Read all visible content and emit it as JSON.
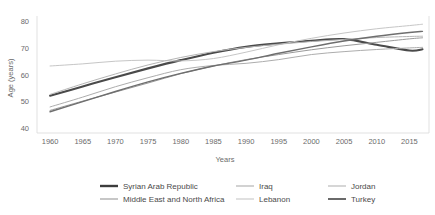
{
  "chart_data": {
    "type": "line",
    "title": "",
    "xlabel": "Years",
    "ylabel": "Age (years)",
    "xlim": [
      1958,
      2018
    ],
    "ylim": [
      38,
      82
    ],
    "xticks": [
      1960,
      1965,
      1970,
      1975,
      1980,
      1985,
      1990,
      1995,
      2000,
      2005,
      2010,
      2015
    ],
    "yticks": [
      40,
      50,
      60,
      70,
      80
    ],
    "grid": false,
    "legend_position": "bottom",
    "x": [
      1960,
      1965,
      1970,
      1975,
      1980,
      1985,
      1990,
      1995,
      2000,
      2005,
      2010,
      2015,
      2017
    ],
    "series": [
      {
        "name": "Syrian Arab Republic",
        "color": "#4a4a4a",
        "width": 2.1,
        "values": [
          52.0,
          55.5,
          59.0,
          62.3,
          65.4,
          68.2,
          70.4,
          71.7,
          72.7,
          73.3,
          71.2,
          69.0,
          69.5
        ]
      },
      {
        "name": "Middle East and North Africa",
        "color": "#9a9a9a",
        "width": 1.0,
        "values": [
          46.5,
          50.0,
          53.4,
          56.8,
          60.3,
          63.2,
          65.6,
          67.5,
          69.3,
          70.8,
          72.1,
          73.4,
          73.8
        ]
      },
      {
        "name": "Iraq",
        "color": "#adadad",
        "width": 1.0,
        "values": [
          47.8,
          51.5,
          55.4,
          58.8,
          61.8,
          63.4,
          64.2,
          65.6,
          67.5,
          68.6,
          69.4,
          70.0,
          70.2
        ]
      },
      {
        "name": "Lebanon",
        "color": "#c6c6c6",
        "width": 1.0,
        "values": [
          63.2,
          64.0,
          65.0,
          65.4,
          65.1,
          66.0,
          68.4,
          71.2,
          73.6,
          75.6,
          77.2,
          78.4,
          78.9
        ]
      },
      {
        "name": "Jordan",
        "color": "#b5b5b5",
        "width": 1.0,
        "values": [
          52.5,
          56.5,
          60.2,
          63.6,
          66.4,
          68.6,
          70.2,
          71.4,
          72.4,
          73.2,
          73.9,
          74.3,
          74.4
        ]
      },
      {
        "name": "Turkey",
        "color": "#6e6e6e",
        "width": 1.4,
        "values": [
          46.0,
          49.8,
          53.6,
          57.2,
          60.4,
          63.2,
          65.4,
          68.0,
          70.4,
          72.6,
          74.4,
          75.8,
          76.2
        ]
      }
    ]
  },
  "legend": {
    "entries": [
      {
        "label": "Syrian Arab Republic",
        "color": "#3d3d3d",
        "width": 2.4
      },
      {
        "label": "Iraq",
        "color": "#adadad",
        "width": 1.1
      },
      {
        "label": "Jordan",
        "color": "#b5b5b5",
        "width": 1.1
      },
      {
        "label": "Middle East and North Africa",
        "color": "#9a9a9a",
        "width": 1.1
      },
      {
        "label": "Lebanon",
        "color": "#c6c6c6",
        "width": 1.1
      },
      {
        "label": "Turkey",
        "color": "#5a5a5a",
        "width": 1.8
      }
    ]
  }
}
